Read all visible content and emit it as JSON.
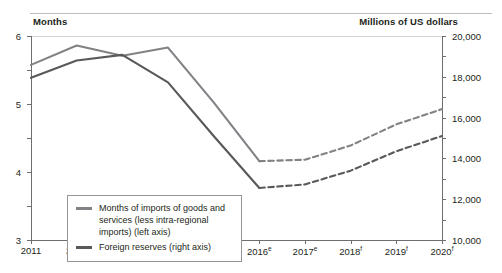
{
  "captions": {
    "left_axis_unit": "Months",
    "right_axis_unit": "Millions of US dollars"
  },
  "axes": {
    "left": {
      "label": "Months",
      "min": 0,
      "max": 6,
      "step": 1,
      "ticks": [
        "0",
        "1",
        "2",
        "3",
        "4",
        "5",
        "6"
      ]
    },
    "right": {
      "label": "Millions of US dollars",
      "min": 0,
      "max": 20000,
      "step": 2000,
      "ticks": [
        "0",
        "2,000",
        "4,000",
        "6,000",
        "8,000",
        "10,000",
        "12,000",
        "14,000",
        "16,000",
        "18,000",
        "20,000"
      ]
    },
    "bottom": {
      "ticks": [
        {
          "year": "2011",
          "marker": ""
        },
        {
          "year": "2012",
          "marker": ""
        },
        {
          "year": "2013",
          "marker": ""
        },
        {
          "year": "2014",
          "marker": ""
        },
        {
          "year": "2015",
          "marker": ""
        },
        {
          "year": "2016",
          "marker": "e"
        },
        {
          "year": "2017",
          "marker": "e"
        },
        {
          "year": "2018",
          "marker": "f"
        },
        {
          "year": "2019",
          "marker": "f"
        },
        {
          "year": "2020",
          "marker": "f"
        }
      ]
    }
  },
  "legend": {
    "items": [
      {
        "label": "Months of imports of goods and services (less intra-regional imports) (left axis)",
        "color": "#808285"
      },
      {
        "label": "Foreign reserves (right axis)",
        "color": "#58595b"
      }
    ]
  },
  "chart_data": {
    "type": "line",
    "title": "",
    "xlabel": "",
    "ylabel": "Months",
    "y2label": "Millions of US dollars",
    "grid": false,
    "legend_position": "inside-bottom-left",
    "x": [
      "2011",
      "2012",
      "2013",
      "2014",
      "2015",
      "2016e",
      "2017e",
      "2018f",
      "2019f",
      "2020f"
    ],
    "ylim": [
      0,
      6
    ],
    "y2lim": [
      0,
      20000
    ],
    "solid_until": "2016e",
    "dashed_from": "2016e",
    "series": [
      {
        "name": "Months of imports of goods and services (less intra-regional imports) (left axis)",
        "axis": "left",
        "unit": "months",
        "color": "#808285",
        "values": [
          5.15,
          5.72,
          5.42,
          5.66,
          4.05,
          2.32,
          2.36,
          2.78,
          3.4,
          3.85
        ]
      },
      {
        "name": "Foreign reserves (right axis)",
        "axis": "right",
        "unit": "millions of US dollars",
        "color": "#58595b",
        "values": [
          15900,
          17600,
          18150,
          15450,
          10200,
          5100,
          5450,
          6800,
          8700,
          10200
        ]
      }
    ],
    "notes": {
      "e": "estimate",
      "f": "forecast"
    }
  }
}
